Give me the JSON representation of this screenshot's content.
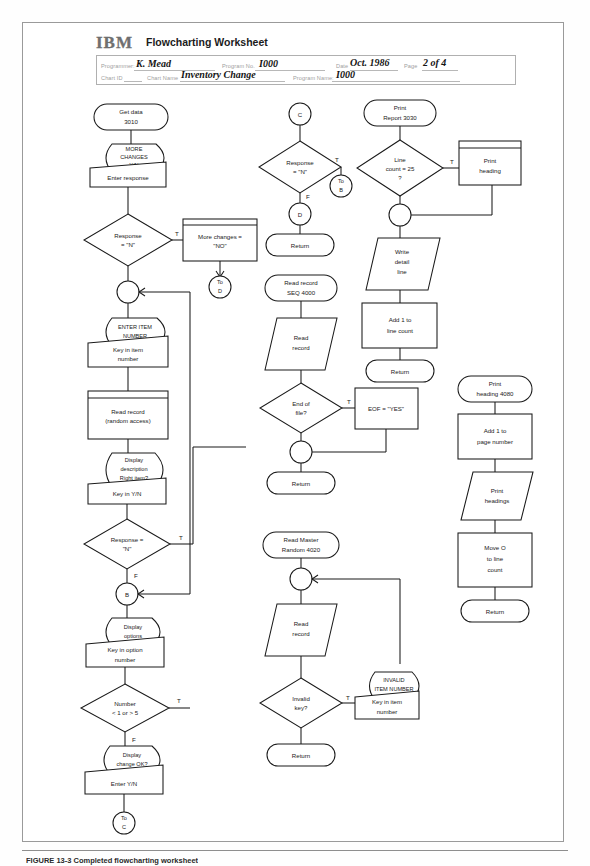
{
  "document": {
    "logo": "IBM",
    "title": "Flowcharting Worksheet",
    "caption": "FIGURE 13-3   Completed flowcharting worksheet"
  },
  "header_form": {
    "fields": [
      {
        "label": "Programmer:",
        "value": "K. Mead"
      },
      {
        "label": "Program No.",
        "value": "I000"
      },
      {
        "label": "Date",
        "value": "Oct. 1986"
      },
      {
        "label": "Page",
        "value": "2 of 4"
      },
      {
        "label": "Chart ID",
        "value": ""
      },
      {
        "label": "Chart Name",
        "value": "Inventory Change"
      },
      {
        "label": "Program Name:",
        "value": "I000"
      }
    ]
  },
  "flowchart": {
    "columns": [
      {
        "name": "column-1-main-routine",
        "nodes": [
          {
            "id": "c1n1",
            "type": "terminal",
            "text": "Get data 3010"
          },
          {
            "id": "c1n2",
            "type": "display",
            "text": "MORE CHANGES Y/N"
          },
          {
            "id": "c1n3",
            "type": "manual-input",
            "text": "Enter response"
          },
          {
            "id": "c1n4",
            "type": "decision",
            "text": "Response = \"N\""
          },
          {
            "id": "c1n5",
            "type": "predefined",
            "text": "More changes = \"NO\""
          },
          {
            "id": "c1n6",
            "type": "connector",
            "text": "To D"
          },
          {
            "id": "c1n7",
            "type": "junction",
            "text": ""
          },
          {
            "id": "c1n8",
            "type": "display",
            "text": "ENTER ITEM NUMBER"
          },
          {
            "id": "c1n9",
            "type": "manual-input",
            "text": "Key in item number"
          },
          {
            "id": "c1n10",
            "type": "predefined",
            "text": "Read record (random access)"
          },
          {
            "id": "c1n11",
            "type": "display",
            "text": "Display description Right item?"
          },
          {
            "id": "c1n12",
            "type": "manual-input",
            "text": "Key in Y/N"
          },
          {
            "id": "c1n13",
            "type": "decision",
            "text": "Response = \"N\""
          },
          {
            "id": "c1n14",
            "type": "connector",
            "text": "B"
          },
          {
            "id": "c1n15",
            "type": "display",
            "text": "Display options"
          },
          {
            "id": "c1n16",
            "type": "manual-input",
            "text": "Key in option number"
          },
          {
            "id": "c1n17",
            "type": "decision",
            "text": "Number < 1 or > 5"
          },
          {
            "id": "c1n18",
            "type": "display",
            "text": "Display change OK?"
          },
          {
            "id": "c1n19",
            "type": "manual-input",
            "text": "Enter Y/N"
          },
          {
            "id": "c1n20",
            "type": "connector",
            "text": "To C"
          }
        ]
      },
      {
        "name": "column-2-subroutines",
        "nodes": [
          {
            "id": "c2n1",
            "type": "connector",
            "text": "C"
          },
          {
            "id": "c2n2",
            "type": "decision",
            "text": "Response = \"N\""
          },
          {
            "id": "c2n3",
            "type": "connector",
            "text": "To B"
          },
          {
            "id": "c2n4",
            "type": "connector",
            "text": "D"
          },
          {
            "id": "c2n5",
            "type": "terminal",
            "text": "Return"
          },
          {
            "id": "c2n6",
            "type": "terminal",
            "text": "Read record SEQ 4000"
          },
          {
            "id": "c2n7",
            "type": "io",
            "text": "Read record"
          },
          {
            "id": "c2n8",
            "type": "decision",
            "text": "End of file?"
          },
          {
            "id": "c2n9",
            "type": "process",
            "text": "EOF = \"YES\""
          },
          {
            "id": "c2n10",
            "type": "junction",
            "text": ""
          },
          {
            "id": "c2n11",
            "type": "terminal",
            "text": "Return"
          },
          {
            "id": "c2n12",
            "type": "terminal",
            "text": "Read Master Random 4020"
          },
          {
            "id": "c2n13",
            "type": "junction",
            "text": ""
          },
          {
            "id": "c2n14",
            "type": "io",
            "text": "Read record"
          },
          {
            "id": "c2n15",
            "type": "decision",
            "text": "Invalid key?"
          },
          {
            "id": "c2n16",
            "type": "display",
            "text": "INVALID ITEM NUMBER"
          },
          {
            "id": "c2n17",
            "type": "manual-input",
            "text": "Key in item number"
          },
          {
            "id": "c2n18",
            "type": "terminal",
            "text": "Return"
          }
        ]
      },
      {
        "name": "column-3-print-report",
        "nodes": [
          {
            "id": "c3n1",
            "type": "terminal",
            "text": "Print Report 3030"
          },
          {
            "id": "c3n2",
            "type": "decision",
            "text": "Line count = 25 ?"
          },
          {
            "id": "c3n3",
            "type": "junction",
            "text": ""
          },
          {
            "id": "c3n4",
            "type": "io",
            "text": "Write detail line"
          },
          {
            "id": "c3n5",
            "type": "process",
            "text": "Add 1 to line count"
          },
          {
            "id": "c3n6",
            "type": "terminal",
            "text": "Return"
          }
        ]
      },
      {
        "name": "column-4-print-heading",
        "nodes": [
          {
            "id": "c4n1",
            "type": "predefined",
            "text": "Print heading"
          },
          {
            "id": "c4n2",
            "type": "terminal",
            "text": "Print heading 4080"
          },
          {
            "id": "c4n3",
            "type": "process",
            "text": "Add 1 to page number"
          },
          {
            "id": "c4n4",
            "type": "io",
            "text": "Print headings"
          },
          {
            "id": "c4n5",
            "type": "process",
            "text": "Move O to line count"
          },
          {
            "id": "c4n6",
            "type": "terminal",
            "text": "Return"
          }
        ]
      }
    ],
    "branch_labels": {
      "c1_resp_true": "T",
      "c1_resp2_true": "T",
      "c1_resp2_false": "F",
      "c1_number_true": "T",
      "c1_number_false": "F",
      "c2_resp_true": "T",
      "c2_resp_false": "F",
      "c2_eof_true": "T",
      "c2_invalid_true": "T",
      "c3_line_true": "T"
    }
  }
}
